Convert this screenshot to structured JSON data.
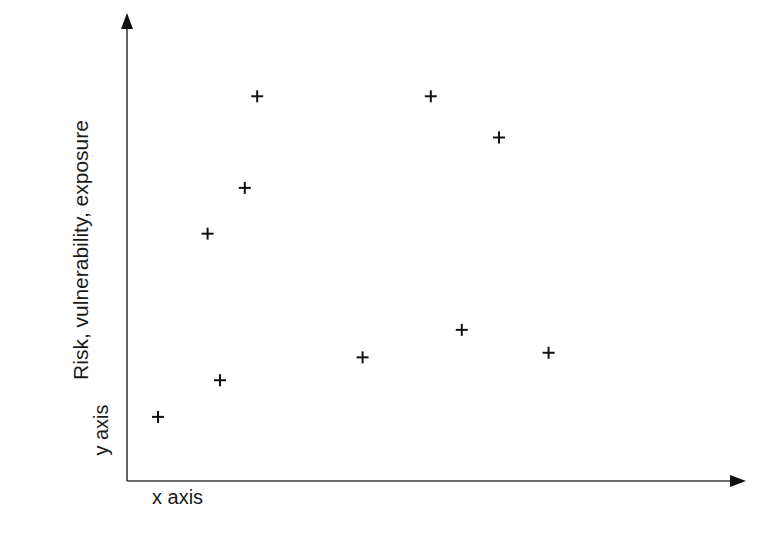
{
  "chart_data": {
    "type": "scatter",
    "title": "",
    "xlabel": "x axis",
    "ylabel": "y axis",
    "y_title": "Risk, vulnerability, exposure",
    "grid": false,
    "legend": null,
    "axis_ticks": false,
    "axis_ranges_note": "No tick labels shown; positions given in relative units (0-100) of plot area",
    "xlim": [
      0,
      100
    ],
    "ylim": [
      0,
      100
    ],
    "marker": "+",
    "points": [
      {
        "x": 5,
        "y": 14
      },
      {
        "x": 15,
        "y": 22
      },
      {
        "x": 13,
        "y": 54
      },
      {
        "x": 19,
        "y": 64
      },
      {
        "x": 21,
        "y": 84
      },
      {
        "x": 38,
        "y": 27
      },
      {
        "x": 49,
        "y": 84
      },
      {
        "x": 54,
        "y": 33
      },
      {
        "x": 60,
        "y": 75
      },
      {
        "x": 68,
        "y": 28
      }
    ]
  },
  "labels": {
    "y_title": "Risk, vulnerability, exposure",
    "y_axis": "y axis",
    "x_axis": "x axis"
  },
  "colors": {
    "axis": "#3a3a3a",
    "marker": "#111111",
    "text": "#1a1a1a",
    "background": "#ffffff"
  }
}
